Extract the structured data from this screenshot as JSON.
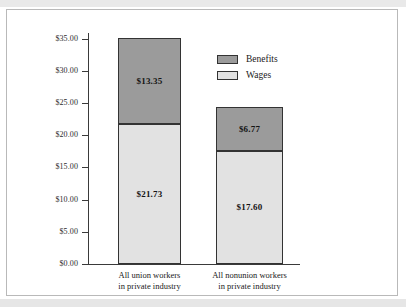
{
  "chart_data": {
    "type": "bar",
    "subtype": "stacked-bar",
    "title": "",
    "xlabel": "",
    "ylabel": "",
    "ylim": [
      0,
      37
    ],
    "grid": false,
    "legend_position": "upper-right-inside",
    "categories": [
      "All union workers\nin private industry",
      "All nonunion workers\nin private industry"
    ],
    "category_lines": [
      [
        "All union workers",
        "in private industry"
      ],
      [
        "All nonunion workers",
        "in private industry"
      ]
    ],
    "series": [
      {
        "name": "Wages",
        "color": "#e2e2e2",
        "values": [
          21.73,
          17.6
        ],
        "labels": [
          "$21.73",
          "$17.60"
        ]
      },
      {
        "name": "Benefits",
        "color": "#9b9b9b",
        "values": [
          13.35,
          6.77
        ],
        "labels": [
          "$13.35",
          "$6.77"
        ]
      }
    ],
    "totals": [
      35.08,
      24.37
    ],
    "yticks": [
      0,
      5,
      10,
      15,
      20,
      25,
      30,
      35
    ],
    "ytick_labels": [
      "$0.00",
      "$5.00",
      "$10.00",
      "$15.00",
      "$20.00",
      "$25.00",
      "$30.00",
      "$35.00"
    ]
  },
  "legend": {
    "items": [
      {
        "label": "Benefits",
        "color": "#9b9b9b"
      },
      {
        "label": "Wages",
        "color": "#e2e2e2"
      }
    ]
  },
  "colors": {
    "benefits": "#9b9b9b",
    "wages": "#e2e2e2",
    "outline": "#333333",
    "axis": "#3a3a3a",
    "frame": "#b9b9b9"
  }
}
